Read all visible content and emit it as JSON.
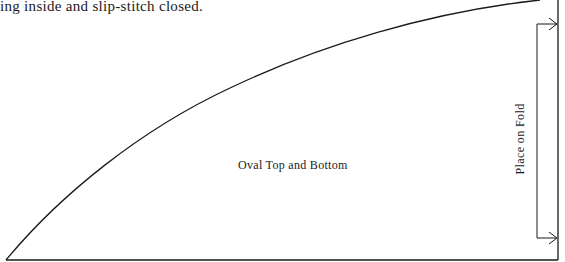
{
  "document": {
    "intro_text": "ing inside and slip-stitch closed.",
    "pattern_piece": {
      "label": "Oval Top and Bottom",
      "fold_label": "Place on Fold",
      "line_color": "#1a1a1a"
    }
  }
}
